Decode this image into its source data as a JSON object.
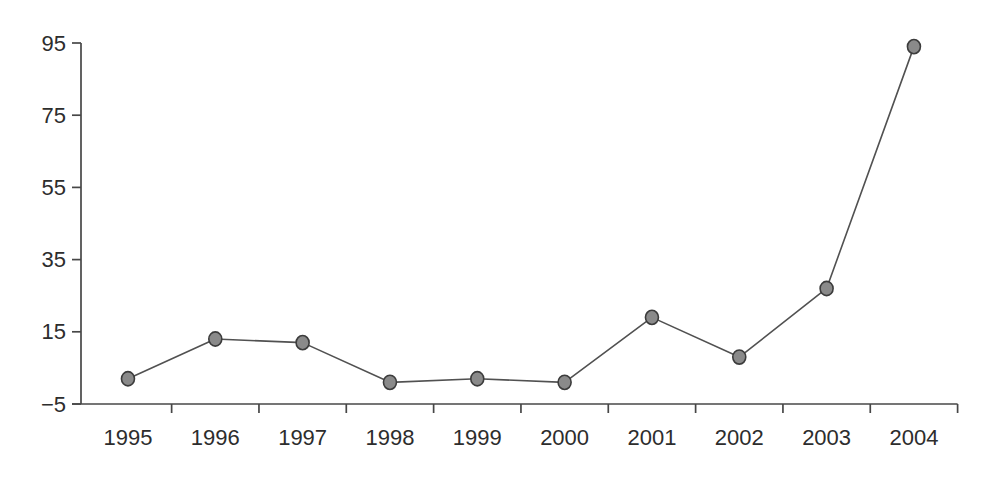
{
  "chart_data": {
    "type": "line",
    "title": "",
    "xlabel": "",
    "ylabel": "",
    "categories": [
      1995,
      1996,
      1997,
      1998,
      1999,
      2000,
      2001,
      2002,
      2003,
      2004
    ],
    "series": [
      {
        "name": "yearly-values",
        "values": [
          2,
          13,
          12,
          1,
          2,
          1,
          19,
          8,
          27,
          94
        ]
      }
    ],
    "ylim": [
      -5,
      95
    ],
    "y_ticks": [
      95,
      75,
      55,
      35,
      15,
      -5
    ],
    "grid": false,
    "legend_position": "none",
    "marker": "filled-circle",
    "colors": {
      "line": "#515151",
      "marker_fill": "#8a8a8a",
      "marker_stroke": "#3c3c3c",
      "axis": "#474747",
      "text": "#2d2d2d",
      "background": "#ffffff"
    }
  }
}
